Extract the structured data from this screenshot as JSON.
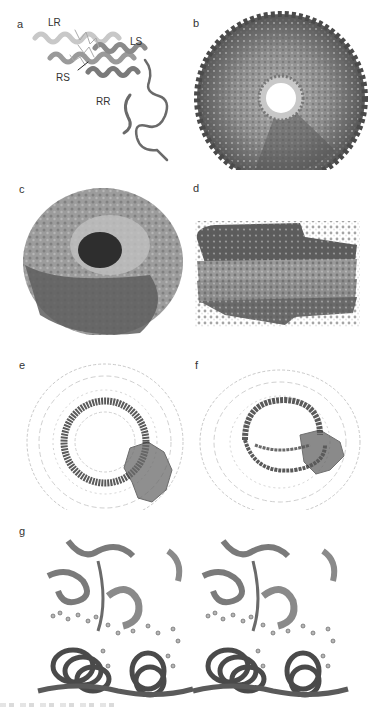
{
  "figure": {
    "panels": [
      {
        "id": "a",
        "label": "a",
        "description": "Ribbon model of single subunit with helices",
        "annotations": [
          "LR",
          "LS",
          "RS",
          "RR"
        ]
      },
      {
        "id": "b",
        "label": "b",
        "description": "Top view of ring assembly, surface representation with central pore"
      },
      {
        "id": "c",
        "label": "c",
        "description": "Tilted view of spiral/helical assembly surface"
      },
      {
        "id": "d",
        "label": "d",
        "description": "Side view of stacked helical assembly, surface"
      },
      {
        "id": "e",
        "label": "e",
        "description": "Top view wireframe/trace with highlighted inner ring"
      },
      {
        "id": "f",
        "label": "f",
        "description": "Tilted view wireframe/trace with highlighted helical turns"
      },
      {
        "id": "g",
        "label": "g",
        "description": "Stereo pair close-up of binding interface with ball-and-stick ligands"
      }
    ]
  },
  "colors": {
    "light_gray": "#c8c8c8",
    "mid_gray": "#8a8a8a",
    "dark_gray": "#4a4a4a",
    "trace_gray": "#bdbdbd"
  }
}
